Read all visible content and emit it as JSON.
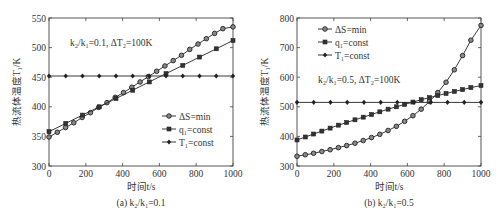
{
  "chart_data": [
    {
      "id": "a",
      "type": "line",
      "caption": "(a) k₂/k₁=0.1",
      "annotation": "k₂/k₁=0.1, ΔT₂=100K",
      "xlabel": "时间t/s",
      "ylabel": "热流体温度T₁/K",
      "xlim": [
        0,
        1000
      ],
      "ylim": [
        300,
        550
      ],
      "xticks": [
        0,
        200,
        400,
        600,
        800,
        1000
      ],
      "yticks": [
        300,
        350,
        400,
        450,
        500,
        550
      ],
      "grid": false,
      "legend_position": "lower right",
      "series": [
        {
          "name": "ΔS=min",
          "marker": "circle-open",
          "x": [
            0,
            45,
            90,
            135,
            180,
            225,
            270,
            315,
            360,
            405,
            450,
            495,
            540,
            585,
            630,
            675,
            720,
            765,
            810,
            855,
            900,
            945,
            1000
          ],
          "values": [
            349,
            357,
            365,
            373,
            382,
            390,
            399,
            407,
            416,
            424,
            433,
            442,
            451,
            460,
            469,
            478,
            487,
            497,
            506,
            515,
            524,
            532,
            535
          ]
        },
        {
          "name": "q₁=const",
          "marker": "square-filled",
          "x": [
            0,
            91,
            182,
            273,
            364,
            455,
            545,
            636,
            727,
            818,
            909,
            1000
          ],
          "values": [
            358,
            372,
            386,
            400,
            414,
            428,
            442,
            456,
            470,
            484,
            498,
            512
          ]
        },
        {
          "name": "T₁=const",
          "marker": "diamond-filled",
          "x": [
            0,
            91,
            182,
            273,
            364,
            455,
            545,
            636,
            727,
            818,
            909,
            1000
          ],
          "values": [
            452,
            452,
            452,
            452,
            452,
            452,
            452,
            452,
            452,
            452,
            452,
            452
          ]
        }
      ]
    },
    {
      "id": "b",
      "type": "line",
      "caption": "(b) k₂/k₁=0.5",
      "annotation": "k₂/k₁=0.5, ΔT₂=100K",
      "xlabel": "时间t/s",
      "ylabel": "热流体温度T₁/K",
      "xlim": [
        0,
        1000
      ],
      "ylim": [
        300,
        800
      ],
      "xticks": [
        0,
        200,
        400,
        600,
        800,
        1000
      ],
      "yticks": [
        300,
        400,
        500,
        600,
        700,
        800
      ],
      "grid": false,
      "legend_position": "upper left",
      "series": [
        {
          "name": "ΔS=min",
          "marker": "circle-open",
          "x": [
            0,
            45,
            90,
            135,
            180,
            225,
            270,
            315,
            360,
            405,
            450,
            495,
            540,
            585,
            630,
            675,
            720,
            765,
            810,
            855,
            900,
            945,
            1000
          ],
          "values": [
            333,
            338,
            343,
            349,
            355,
            362,
            369,
            377,
            386,
            396,
            407,
            420,
            434,
            451,
            470,
            492,
            518,
            548,
            583,
            625,
            673,
            725,
            775
          ]
        },
        {
          "name": "q₁=const",
          "marker": "square-filled",
          "x": [
            0,
            45,
            90,
            135,
            180,
            225,
            270,
            315,
            360,
            405,
            450,
            495,
            540,
            585,
            630,
            675,
            720,
            765,
            810,
            855,
            900,
            945,
            1000
          ],
          "values": [
            388,
            398,
            408,
            418,
            428,
            438,
            447,
            456,
            465,
            474,
            483,
            492,
            500,
            508,
            516,
            524,
            531,
            538,
            545,
            552,
            558,
            565,
            572
          ]
        },
        {
          "name": "T₁=const",
          "marker": "diamond-filled",
          "x": [
            0,
            91,
            182,
            273,
            364,
            455,
            545,
            636,
            727,
            818,
            909,
            1000
          ],
          "values": [
            515,
            515,
            515,
            515,
            515,
            515,
            515,
            515,
            515,
            515,
            515,
            515
          ]
        }
      ]
    }
  ]
}
